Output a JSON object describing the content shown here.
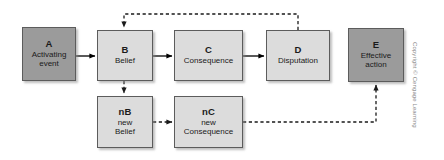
{
  "diagram": {
    "type": "flow-diagram",
    "copyright": "Copyright © Cengage Learning",
    "colors": {
      "dark_box_fill": "#9b9b9b",
      "light_box_fill": "#dcdcdc",
      "box_border": "#5c5c5c",
      "arrow_solid": "#000000",
      "arrow_dashed": "#333333",
      "background": "#ffffff",
      "copyright_text": "#8a8a8a"
    },
    "nodes": [
      {
        "id": "A",
        "code": "A",
        "label": "Activating\nevent",
        "style": "dark",
        "x": 22,
        "y": 27,
        "w": 54,
        "h": 54
      },
      {
        "id": "B",
        "code": "B",
        "label": "Belief",
        "style": "light",
        "x": 97,
        "y": 30,
        "w": 56,
        "h": 51
      },
      {
        "id": "C",
        "code": "C",
        "label": "Consequence",
        "style": "light",
        "x": 174,
        "y": 30,
        "w": 69,
        "h": 51
      },
      {
        "id": "D",
        "code": "D",
        "label": "Disputation",
        "style": "light",
        "x": 266,
        "y": 30,
        "w": 64,
        "h": 51
      },
      {
        "id": "E",
        "code": "E",
        "label": "Effective\naction",
        "style": "dark",
        "x": 348,
        "y": 28,
        "w": 56,
        "h": 54
      },
      {
        "id": "nB",
        "code": "nB",
        "label": "new\nBelief",
        "style": "light",
        "x": 97,
        "y": 96,
        "w": 56,
        "h": 52
      },
      {
        "id": "nC",
        "code": "nC",
        "label": "new\nConsequence",
        "style": "light",
        "x": 174,
        "y": 96,
        "w": 69,
        "h": 52
      }
    ],
    "edges": [
      {
        "id": "a-to-b",
        "from": "A",
        "to": "B",
        "style": "solid",
        "direction": "right"
      },
      {
        "id": "b-to-c",
        "from": "B",
        "to": "C",
        "style": "solid",
        "direction": "right"
      },
      {
        "id": "c-to-d",
        "from": "C",
        "to": "D",
        "style": "solid",
        "direction": "right"
      },
      {
        "id": "d-to-b-feedback",
        "from": "D",
        "to": "B",
        "style": "dashed",
        "direction": "up-left-down"
      },
      {
        "id": "b-to-nb",
        "from": "B",
        "to": "nB",
        "style": "dashed",
        "direction": "down"
      },
      {
        "id": "nb-to-nc",
        "from": "nB",
        "to": "nC",
        "style": "dashed",
        "direction": "right"
      },
      {
        "id": "nc-to-e",
        "from": "nC",
        "to": "E",
        "style": "dashed",
        "direction": "right-up"
      }
    ]
  }
}
